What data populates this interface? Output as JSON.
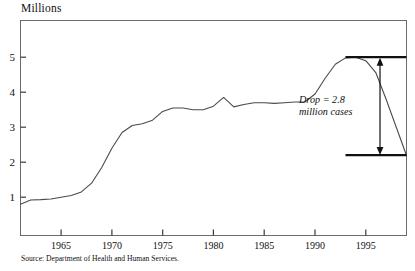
{
  "figure": {
    "unit_label": "Millions",
    "source_note": "Source: Department of Health and Human Services."
  },
  "annotation": {
    "line1": "Drop = 2.8",
    "line2": "million cases",
    "peak_value": 5.0,
    "trough_value": 2.2,
    "drop_value": 2.8
  },
  "chart_data": {
    "type": "line",
    "title": "",
    "subtitle": "",
    "xlabel": "",
    "ylabel": "Millions",
    "xlim": [
      1961,
      1999
    ],
    "ylim": [
      0,
      5.9
    ],
    "grid": false,
    "legend": "none",
    "x_ticks": [
      1965,
      1970,
      1975,
      1980,
      1985,
      1990,
      1995
    ],
    "x_tick_labels": [
      "1965",
      "1970",
      "1975",
      "1980",
      "1985",
      "1990",
      "1995"
    ],
    "y_ticks": [
      1,
      2,
      3,
      4,
      5
    ],
    "y_tick_labels": [
      "1",
      "2",
      "3",
      "4",
      "5"
    ],
    "series": [
      {
        "name": "Welfare caseload",
        "x": [
          1961,
          1962,
          1963,
          1964,
          1965,
          1966,
          1967,
          1968,
          1969,
          1970,
          1971,
          1972,
          1973,
          1974,
          1975,
          1976,
          1977,
          1978,
          1979,
          1980,
          1981,
          1982,
          1983,
          1984,
          1985,
          1986,
          1987,
          1988,
          1989,
          1990,
          1991,
          1992,
          1993,
          1994,
          1995,
          1996,
          1997,
          1998,
          1999
        ],
        "values": [
          0.8,
          0.92,
          0.93,
          0.95,
          1.0,
          1.05,
          1.15,
          1.4,
          1.85,
          2.4,
          2.85,
          3.05,
          3.1,
          3.2,
          3.45,
          3.55,
          3.55,
          3.5,
          3.5,
          3.6,
          3.85,
          3.58,
          3.65,
          3.7,
          3.7,
          3.68,
          3.7,
          3.72,
          3.72,
          3.95,
          4.4,
          4.8,
          4.98,
          5.0,
          4.9,
          4.55,
          3.8,
          3.0,
          2.2
        ]
      }
    ],
    "reference_lines": [
      {
        "name": "peak-level",
        "value": 5.0,
        "x_start": 1993,
        "x_end": 1999
      },
      {
        "name": "trough-level",
        "value": 2.2,
        "x_start": 1993,
        "x_end": 1999
      }
    ],
    "arrow": {
      "x": 1996.4,
      "y_top": 5.0,
      "y_bottom": 2.2
    }
  }
}
